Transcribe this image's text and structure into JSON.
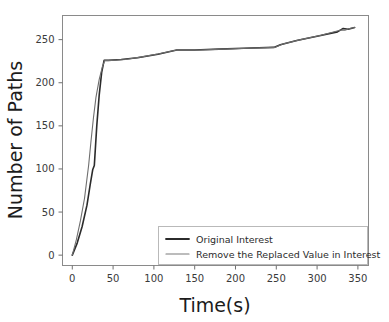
{
  "chart_data": {
    "type": "line",
    "title": "",
    "xlabel": "Time(s)",
    "ylabel": "Number of Paths",
    "xlim": [
      -12,
      363
    ],
    "ylim": [
      -12,
      278
    ],
    "xticks": [
      0,
      50,
      100,
      150,
      200,
      250,
      300,
      350
    ],
    "xtick_labels": [
      "0",
      "50",
      "100",
      "150",
      "200",
      "250",
      "300",
      "350"
    ],
    "yticks": [
      0,
      50,
      100,
      150,
      200,
      250
    ],
    "ytick_labels": [
      "0",
      "50",
      "100",
      "150",
      "200",
      "250"
    ],
    "grid": false,
    "legend_position": "lower right",
    "series": [
      {
        "name": "Original Interest",
        "color": "#2b2b2b",
        "linewidth": 1.6,
        "points": [
          [
            0,
            0
          ],
          [
            6,
            14
          ],
          [
            12,
            33
          ],
          [
            18,
            58
          ],
          [
            22,
            82
          ],
          [
            25,
            99
          ],
          [
            27,
            104
          ],
          [
            30,
            150
          ],
          [
            33,
            186
          ],
          [
            36,
            212
          ],
          [
            39,
            226
          ],
          [
            44,
            226
          ],
          [
            60,
            227
          ],
          [
            80,
            229
          ],
          [
            105,
            233
          ],
          [
            128,
            238
          ],
          [
            150,
            238
          ],
          [
            180,
            239
          ],
          [
            210,
            240
          ],
          [
            247,
            241
          ],
          [
            255,
            244
          ],
          [
            275,
            249
          ],
          [
            300,
            254
          ],
          [
            325,
            259
          ],
          [
            332,
            263
          ],
          [
            338,
            262
          ],
          [
            346,
            264
          ]
        ]
      },
      {
        "name": "Remove the Replaced Value in Interest",
        "color": "#6e6e6e",
        "linewidth": 1.1,
        "points": [
          [
            0,
            0
          ],
          [
            5,
            18
          ],
          [
            10,
            40
          ],
          [
            15,
            66
          ],
          [
            20,
            104
          ],
          [
            23,
            133
          ],
          [
            26,
            160
          ],
          [
            29,
            183
          ],
          [
            33,
            204
          ],
          [
            37,
            219
          ],
          [
            40,
            226
          ],
          [
            48,
            226
          ],
          [
            65,
            227
          ],
          [
            85,
            230
          ],
          [
            108,
            234
          ],
          [
            128,
            238
          ],
          [
            155,
            238
          ],
          [
            185,
            239
          ],
          [
            215,
            240
          ],
          [
            248,
            241
          ],
          [
            258,
            245
          ],
          [
            280,
            250
          ],
          [
            305,
            255
          ],
          [
            328,
            261
          ],
          [
            334,
            261
          ],
          [
            340,
            263
          ],
          [
            346,
            264
          ]
        ]
      }
    ]
  },
  "legend": {
    "entries": [
      {
        "label": "Original Interest"
      },
      {
        "label": "Remove the Replaced Value in Interest"
      }
    ]
  }
}
